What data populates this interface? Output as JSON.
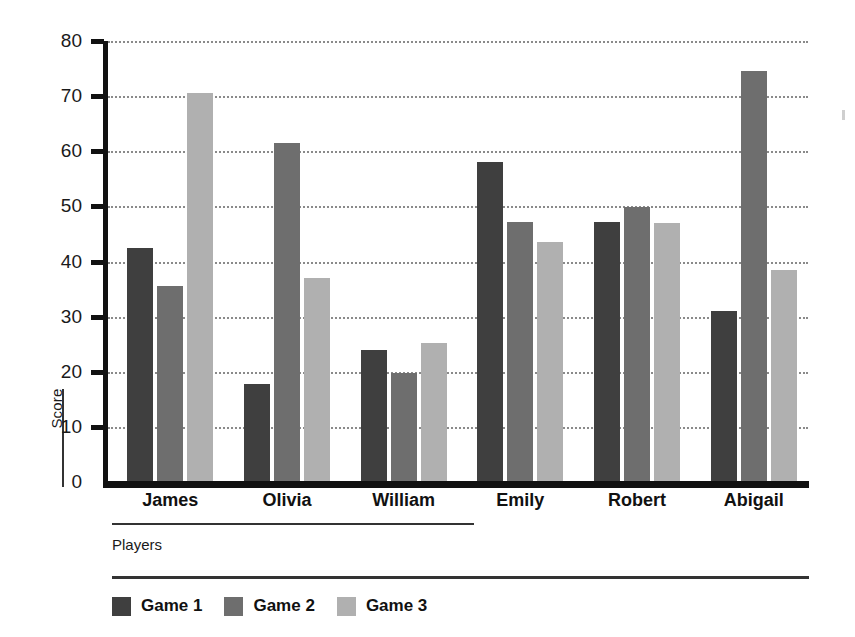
{
  "chart_data": {
    "type": "bar",
    "title": "",
    "xlabel": "Players",
    "ylabel": "Score",
    "categories": [
      "James",
      "Olivia",
      "William",
      "Emily",
      "Robert",
      "Abigail"
    ],
    "series": [
      {
        "name": "Game 1",
        "color": "#3f3f3f",
        "values": [
          42.5,
          17.8,
          24.0,
          58.0,
          47.2,
          31.0
        ]
      },
      {
        "name": "Game 2",
        "color": "#6e6e6e",
        "values": [
          35.6,
          61.5,
          19.8,
          47.2,
          49.8,
          74.6
        ]
      },
      {
        "name": "Game 3",
        "color": "#b0b0b0",
        "values": [
          70.5,
          37.0,
          25.2,
          43.5,
          47.0,
          38.4
        ]
      }
    ],
    "ylim": [
      0,
      80
    ],
    "yticks": [
      0,
      10,
      20,
      30,
      40,
      50,
      60,
      70,
      80
    ],
    "ytick_labels": [
      "0",
      "10",
      "20",
      "30",
      "40",
      "50",
      "60",
      "70",
      "80"
    ],
    "grid": true,
    "grid_style": "dotted",
    "legend_position": "bottom-left",
    "axis_color": "#111111",
    "background": "#ffffff"
  },
  "axes": {
    "y_title": "Score",
    "x_title": "Players"
  },
  "legend": {
    "items": [
      {
        "label": "Game 1"
      },
      {
        "label": "Game 2"
      },
      {
        "label": "Game 3"
      }
    ]
  }
}
